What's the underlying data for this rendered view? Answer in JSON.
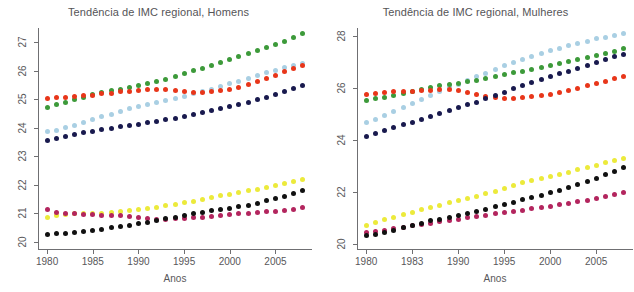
{
  "figure": {
    "width": 634,
    "height": 292,
    "background": "#ffffff"
  },
  "chart_data": [
    {
      "id": "homens",
      "type": "scatter",
      "title": "Tendência de IMC regional, Homens",
      "xlabel": "Anos",
      "ylabel": "",
      "xlim": [
        1979,
        2009
      ],
      "ylim": [
        19.75,
        27.5
      ],
      "xticks": [
        1980,
        1985,
        1990,
        1995,
        2000,
        2005
      ],
      "xtick_labels": [
        "1980",
        "1985",
        "1990",
        "1995",
        "2000",
        "2005"
      ],
      "yticks": [
        20,
        21,
        22,
        23,
        24,
        25,
        26,
        27
      ],
      "ytick_labels": [
        "20",
        "21",
        "22",
        "23",
        "24",
        "25",
        "26",
        "27"
      ],
      "grid": false,
      "legend": "none",
      "x": [
        1980,
        1981,
        1982,
        1983,
        1984,
        1985,
        1986,
        1987,
        1988,
        1989,
        1990,
        1991,
        1992,
        1993,
        1994,
        1995,
        1996,
        1997,
        1998,
        1999,
        2000,
        2001,
        2002,
        2003,
        2004,
        2005,
        2006,
        2007,
        2008
      ],
      "series": [
        {
          "name": "red-series",
          "color": "#e8361a",
          "values": [
            25.03,
            25.06,
            25.08,
            25.11,
            25.13,
            25.15,
            25.19,
            25.22,
            25.26,
            25.29,
            25.32,
            25.33,
            25.34,
            25.33,
            25.31,
            25.28,
            25.25,
            25.24,
            25.26,
            25.3,
            25.36,
            25.43,
            25.52,
            25.62,
            25.73,
            25.85,
            25.97,
            26.08,
            26.19
          ]
        },
        {
          "name": "green-series",
          "color": "#3d9a3a",
          "values": [
            24.71,
            24.8,
            24.89,
            24.98,
            25.07,
            25.16,
            25.25,
            25.3,
            25.35,
            25.41,
            25.47,
            25.54,
            25.62,
            25.71,
            25.81,
            25.91,
            26.0,
            26.09,
            26.19,
            26.3,
            26.4,
            26.5,
            26.6,
            26.71,
            26.82,
            26.93,
            27.04,
            27.16,
            27.29
          ]
        },
        {
          "name": "lightblue-series",
          "color": "#a9cfe3"
        },
        {
          "name": "navy-series",
          "color": "#191a4e"
        },
        {
          "name": "yellow-series",
          "color": "#ecea3b"
        },
        {
          "name": "crimson-series",
          "color": "#b3255e"
        },
        {
          "name": "black-series",
          "color": "#111111"
        }
      ],
      "series_values": {
        "lightblue-series": [
          23.86,
          23.92,
          24.0,
          24.09,
          24.18,
          24.28,
          24.38,
          24.47,
          24.57,
          24.66,
          24.74,
          24.82,
          24.9,
          24.97,
          25.04,
          25.11,
          25.19,
          25.27,
          25.36,
          25.45,
          25.54,
          25.64,
          25.74,
          25.84,
          25.93,
          26.02,
          26.1,
          26.17,
          26.24
        ]
      },
      "series_values_navy": [
        23.57,
        23.63,
        23.7,
        23.77,
        23.83,
        23.88,
        23.93,
        23.98,
        24.03,
        24.08,
        24.12,
        24.17,
        24.22,
        24.28,
        24.34,
        24.4,
        24.47,
        24.54,
        24.6,
        24.67,
        24.74,
        24.81,
        24.89,
        24.98,
        25.07,
        25.17,
        25.28,
        25.39,
        25.5
      ],
      "series_values_yellow": [
        20.87,
        20.93,
        20.97,
        21.0,
        21.0,
        20.98,
        21.0,
        21.03,
        21.07,
        21.1,
        21.14,
        21.18,
        21.22,
        21.27,
        21.32,
        21.38,
        21.43,
        21.49,
        21.56,
        21.61,
        21.67,
        21.72,
        21.79,
        21.85,
        21.92,
        21.98,
        22.05,
        22.12,
        22.19
      ],
      "series_values_crimson": [
        21.12,
        21.04,
        21.0,
        20.99,
        20.97,
        20.95,
        20.93,
        20.92,
        20.91,
        20.88,
        20.85,
        20.82,
        20.8,
        20.8,
        20.81,
        20.83,
        20.84,
        20.86,
        20.89,
        20.92,
        20.95,
        20.98,
        21.0,
        21.02,
        21.05,
        21.07,
        21.09,
        21.12,
        21.22
      ],
      "series_values_black": [
        20.27,
        20.28,
        20.3,
        20.33,
        20.37,
        20.41,
        20.45,
        20.5,
        20.54,
        20.59,
        20.63,
        20.68,
        20.74,
        20.81,
        20.87,
        20.93,
        20.99,
        21.04,
        21.09,
        21.14,
        21.18,
        21.23,
        21.29,
        21.36,
        21.44,
        21.52,
        21.6,
        21.7,
        21.8
      ]
    },
    {
      "id": "mulheres",
      "type": "scatter",
      "title": "Tendência de IMC regional, Mulheres",
      "xlabel": "Anos",
      "ylabel": "",
      "xlim": [
        1979,
        2009
      ],
      "ylim": [
        19.8,
        28.3
      ],
      "xticks": [
        1980,
        1985,
        1990,
        1995,
        2000,
        2005
      ],
      "xtick_labels": [
        "1980",
        "1983",
        "1990",
        "1995",
        "2000",
        "2005"
      ],
      "yticks": [
        20,
        22,
        24,
        26,
        28
      ],
      "ytick_labels": [
        "20",
        "22",
        "24",
        "26",
        "28"
      ],
      "grid": false,
      "legend": "none",
      "x": [
        1980,
        1981,
        1982,
        1983,
        1984,
        1985,
        1986,
        1987,
        1988,
        1989,
        1990,
        1991,
        1992,
        1993,
        1994,
        1995,
        1996,
        1997,
        1998,
        1999,
        2000,
        2001,
        2002,
        2003,
        2004,
        2005,
        2006,
        2007,
        2008
      ],
      "series": [
        {
          "name": "red-series",
          "color": "#e8361a",
          "values": [
            25.76,
            25.8,
            25.82,
            25.85,
            25.86,
            25.87,
            25.88,
            25.9,
            25.92,
            25.93,
            25.9,
            25.83,
            25.75,
            25.68,
            25.63,
            25.6,
            25.6,
            25.62,
            25.65,
            25.7,
            25.76,
            25.82,
            25.9,
            25.99,
            26.08,
            26.17,
            26.26,
            26.35,
            26.45
          ]
        },
        {
          "name": "green-series",
          "color": "#3d9a3a",
          "values": [
            25.5,
            25.57,
            25.64,
            25.71,
            25.78,
            25.85,
            25.93,
            26.0,
            26.07,
            26.12,
            26.18,
            26.24,
            26.3,
            26.36,
            26.43,
            26.5,
            26.57,
            26.64,
            26.71,
            26.79,
            26.86,
            26.93,
            27.0,
            27.08,
            27.16,
            27.24,
            27.32,
            27.41,
            27.5
          ]
        },
        {
          "name": "lightblue-series",
          "color": "#a9cfe3"
        },
        {
          "name": "navy-series",
          "color": "#191a4e"
        },
        {
          "name": "yellow-series",
          "color": "#ecea3b"
        },
        {
          "name": "crimson-series",
          "color": "#b3255e"
        },
        {
          "name": "black-series",
          "color": "#111111"
        }
      ],
      "series_values_lightblue": [
        24.66,
        24.8,
        24.95,
        25.1,
        25.25,
        25.4,
        25.55,
        25.7,
        25.85,
        26.0,
        26.14,
        26.28,
        26.42,
        26.56,
        26.7,
        26.84,
        26.97,
        27.1,
        27.22,
        27.33,
        27.43,
        27.53,
        27.62,
        27.71,
        27.8,
        27.88,
        27.95,
        28.02,
        28.1
      ],
      "series_values_navy": [
        24.14,
        24.24,
        24.35,
        24.46,
        24.57,
        24.68,
        24.79,
        24.9,
        25.01,
        25.12,
        25.23,
        25.34,
        25.45,
        25.57,
        25.7,
        25.83,
        25.96,
        26.09,
        26.21,
        26.32,
        26.43,
        26.54,
        26.64,
        26.75,
        26.86,
        26.97,
        27.08,
        27.19,
        27.3
      ],
      "series_values_yellow": [
        20.71,
        20.82,
        20.93,
        21.03,
        21.13,
        21.22,
        21.31,
        21.4,
        21.49,
        21.57,
        21.65,
        21.73,
        21.83,
        21.93,
        22.03,
        22.13,
        22.24,
        22.34,
        22.44,
        22.52,
        22.6,
        22.68,
        22.76,
        22.85,
        22.94,
        23.03,
        23.12,
        23.21,
        23.3
      ],
      "series_values_crimson": [
        20.43,
        20.47,
        20.52,
        20.58,
        20.64,
        20.7,
        20.76,
        20.8,
        20.85,
        20.9,
        20.95,
        21.0,
        21.05,
        21.1,
        21.15,
        21.2,
        21.25,
        21.3,
        21.35,
        21.4,
        21.45,
        21.5,
        21.56,
        21.62,
        21.68,
        21.75,
        21.82,
        21.9,
        21.97
      ],
      "series_values_black": [
        20.32,
        20.37,
        20.43,
        20.52,
        20.62,
        20.72,
        20.8,
        20.88,
        20.95,
        21.02,
        21.09,
        21.16,
        21.24,
        21.33,
        21.42,
        21.51,
        21.6,
        21.69,
        21.78,
        21.87,
        21.96,
        22.06,
        22.17,
        22.29,
        22.41,
        22.53,
        22.66,
        22.79,
        22.92
      ]
    }
  ]
}
